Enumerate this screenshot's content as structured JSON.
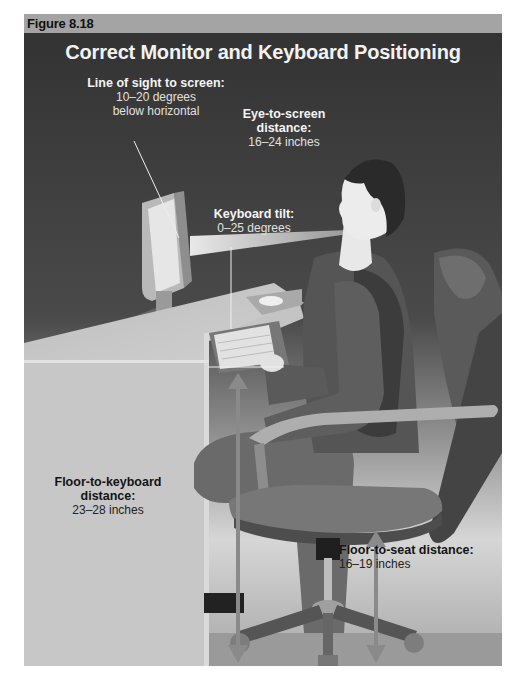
{
  "figure": {
    "label": "Figure 8.18",
    "title": "Correct Monitor and Keyboard Positioning"
  },
  "annotations": {
    "line_of_sight": {
      "heading": "Line of sight to screen:",
      "line1": "10–20 degrees",
      "line2": "below horizontal"
    },
    "eye_to_screen": {
      "heading1": "Eye-to-screen",
      "heading2": "distance:",
      "value": "16–24 inches"
    },
    "keyboard_tilt": {
      "heading": "Keyboard tilt:",
      "value": "0–25 degrees"
    },
    "floor_to_keyboard": {
      "heading1": "Floor-to-keyboard",
      "heading2": "distance:",
      "value": "23–28 inches"
    },
    "floor_to_seat": {
      "heading": "Floor-to-seat distance:",
      "value": "16–19 inches"
    }
  },
  "colors": {
    "header_bar": "#a4a4a4",
    "background_dark": "#3a3a3a",
    "background_light": "#cfcfcf",
    "measurement_arrow": "#8a8a8a"
  }
}
